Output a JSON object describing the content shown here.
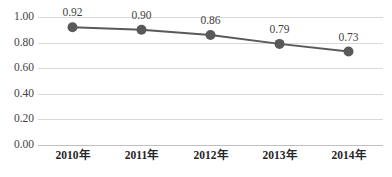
{
  "chart_data": {
    "type": "line",
    "title": "",
    "subtitle": "",
    "xlabel": "",
    "ylabel": "",
    "categories": [
      "2010年",
      "2011年",
      "2012年",
      "2013年",
      "2014年"
    ],
    "values": [
      0.92,
      0.9,
      0.86,
      0.79,
      0.73
    ],
    "data_labels": [
      "0.92",
      "0.90",
      "0.86",
      "0.79",
      "0.73"
    ],
    "series": [
      {
        "name": "",
        "values": [
          0.92,
          0.9,
          0.86,
          0.79,
          0.73
        ]
      }
    ],
    "ylim": [
      0.0,
      1.0
    ],
    "ytick_values": [
      0.0,
      0.2,
      0.4,
      0.6,
      0.8,
      1.0
    ],
    "ytick_labels": [
      "0.00",
      "0.20",
      "0.40",
      "0.60",
      "0.80",
      "1.00"
    ],
    "grid": {
      "horizontal": true,
      "vertical": false
    },
    "legend": {
      "visible": false,
      "position": "none"
    },
    "colors": {
      "line": "#595959",
      "marker": "#595959",
      "gridline": "#d9d9d9",
      "axis": "#bfbfbf",
      "tick_text": "#3f3f3f",
      "category_text": "#262626",
      "background": "#ffffff"
    },
    "style": {
      "line_width": 2,
      "marker_shape": "circle",
      "marker_radius": 5.0,
      "data_labels_visible": true,
      "data_label_position": "above"
    }
  }
}
